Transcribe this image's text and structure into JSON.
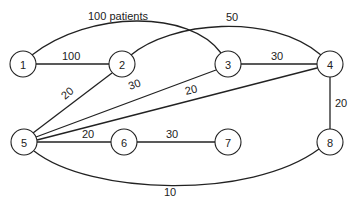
{
  "diagram": {
    "type": "network-graph",
    "node_radius": 13,
    "nodes": [
      {
        "id": "1",
        "label": "1",
        "x": 23,
        "y": 64
      },
      {
        "id": "2",
        "label": "2",
        "x": 122,
        "y": 64
      },
      {
        "id": "3",
        "label": "3",
        "x": 228,
        "y": 64
      },
      {
        "id": "4",
        "label": "4",
        "x": 330,
        "y": 64
      },
      {
        "id": "5",
        "label": "5",
        "x": 24,
        "y": 142
      },
      {
        "id": "6",
        "label": "6",
        "x": 124,
        "y": 142
      },
      {
        "id": "7",
        "label": "7",
        "x": 228,
        "y": 142
      },
      {
        "id": "8",
        "label": "8",
        "x": 330,
        "y": 142
      }
    ],
    "edges": [
      {
        "from": "1",
        "to": "3",
        "label": "100 patients",
        "curve": "M32,55 C90,10 190,10 221,53",
        "lx": 88,
        "ly": 20,
        "rot": 0
      },
      {
        "from": "1",
        "to": "2",
        "label": "100",
        "curve": "M36,64 L109,64",
        "lx": 62,
        "ly": 60,
        "rot": 0
      },
      {
        "from": "2",
        "to": "4",
        "label": "50",
        "curve": "M131,55 C170,22 270,12 321,55",
        "lx": 226,
        "ly": 21,
        "rot": 0
      },
      {
        "from": "3",
        "to": "4",
        "label": "30",
        "curve": "M241,64 L317,64",
        "lx": 271,
        "ly": 60,
        "rot": 0
      },
      {
        "from": "2",
        "to": "5",
        "label": "20",
        "curve": "M112,73 L33,133",
        "lx": 65,
        "ly": 100,
        "rot": -40
      },
      {
        "from": "3",
        "to": "5",
        "label": "30",
        "curve": "M216,70 L36,137",
        "lx": 130,
        "ly": 90,
        "rot": -20
      },
      {
        "from": "4",
        "to": "5",
        "label": "20",
        "curve": "M317,68 L37,140",
        "lx": 186,
        "ly": 95,
        "rot": -14
      },
      {
        "from": "5",
        "to": "6",
        "label": "20",
        "curve": "M37,142 L111,142",
        "lx": 82,
        "ly": 138,
        "rot": 0
      },
      {
        "from": "6",
        "to": "7",
        "label": "30",
        "curve": "M137,142 L215,142",
        "lx": 166,
        "ly": 138,
        "rot": 0
      },
      {
        "from": "4",
        "to": "8",
        "label": "20",
        "curve": "M330,77 L330,129",
        "lx": 335,
        "ly": 107,
        "rot": 0
      },
      {
        "from": "5",
        "to": "8",
        "label": "10",
        "curve": "M34,151 C90,195 250,200 319,149",
        "lx": 164,
        "ly": 196,
        "rot": 0
      }
    ]
  }
}
